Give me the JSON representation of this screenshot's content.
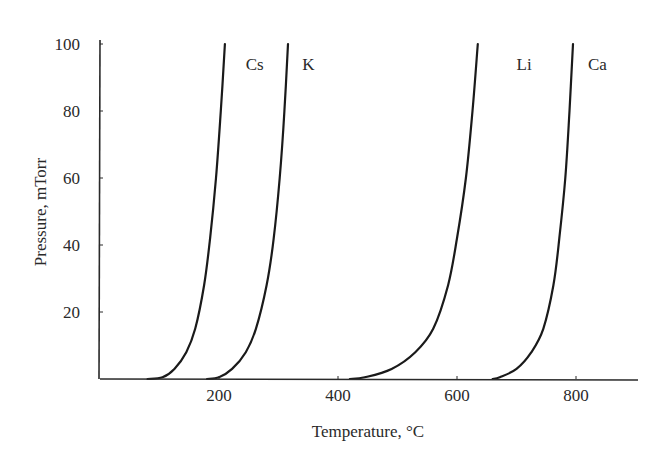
{
  "chart_data": {
    "type": "line",
    "title": "",
    "xlabel": "Temperature, °C",
    "ylabel": "Pressure, mTorr",
    "xlim": [
      0,
      900
    ],
    "ylim": [
      0,
      100
    ],
    "xticks": [
      200,
      400,
      600,
      800
    ],
    "yticks": [
      20,
      40,
      60,
      80,
      100
    ],
    "grid": false,
    "legend": "inline labels near top of each curve",
    "series": [
      {
        "name": "Cs",
        "color": "#1a1a1a",
        "x": [
          80,
          105,
          125,
          145,
          160,
          175,
          185,
          195,
          203,
          210
        ],
        "y": [
          0,
          0.5,
          3,
          8,
          15,
          28,
          42,
          60,
          80,
          100
        ]
      },
      {
        "name": "K",
        "color": "#1a1a1a",
        "x": [
          180,
          200,
          222,
          245,
          262,
          280,
          292,
          302,
          310,
          316
        ],
        "y": [
          0,
          0.5,
          3,
          8,
          15,
          28,
          42,
          60,
          80,
          100
        ]
      },
      {
        "name": "Li",
        "color": "#1a1a1a",
        "x": [
          420,
          445,
          490,
          530,
          560,
          585,
          600,
          615,
          626,
          635
        ],
        "y": [
          0,
          0.5,
          3,
          8,
          15,
          28,
          42,
          60,
          80,
          100
        ]
      },
      {
        "name": "Ca",
        "color": "#1a1a1a",
        "x": [
          660,
          672,
          700,
          725,
          745,
          762,
          772,
          782,
          789,
          795
        ],
        "y": [
          0,
          0.5,
          3,
          8,
          15,
          28,
          42,
          60,
          80,
          100
        ]
      }
    ],
    "series_labels": [
      {
        "name": "Cs",
        "x": 245,
        "y": 94
      },
      {
        "name": "K",
        "x": 340,
        "y": 94
      },
      {
        "name": "Li",
        "x": 700,
        "y": 94
      },
      {
        "name": "Ca",
        "x": 820,
        "y": 94
      }
    ]
  }
}
